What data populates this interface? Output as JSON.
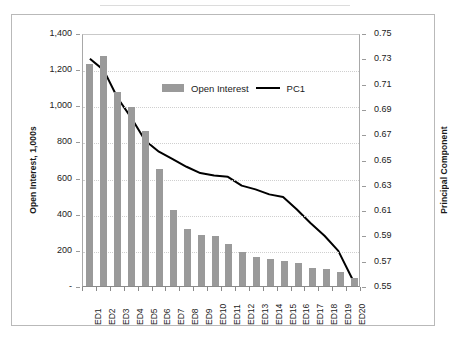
{
  "chart_data": {
    "type": "bar",
    "title": "",
    "subtitle": "",
    "categories": [
      "ED1",
      "ED2",
      "ED3",
      "ED4",
      "ED5",
      "ED6",
      "ED7",
      "ED8",
      "ED9",
      "ED10",
      "ED11",
      "ED12",
      "ED13",
      "ED14",
      "ED15",
      "ED16",
      "ED17",
      "ED18",
      "ED19",
      "ED20"
    ],
    "series": [
      {
        "name": "Open Interest",
        "type": "bar",
        "axis": "left",
        "color": "#9a9a9a",
        "values": [
          1230,
          1275,
          1075,
          990,
          860,
          650,
          420,
          315,
          280,
          275,
          230,
          190,
          160,
          150,
          140,
          125,
          100,
          95,
          80,
          45
        ]
      },
      {
        "name": "PC1",
        "type": "line",
        "axis": "right",
        "color": "#000000",
        "values": [
          0.731,
          0.722,
          0.7,
          0.684,
          0.666,
          0.657,
          0.651,
          0.645,
          0.64,
          0.638,
          0.637,
          0.63,
          0.627,
          0.623,
          0.621,
          0.611,
          0.6,
          0.59,
          0.578,
          0.556
        ]
      }
    ],
    "xlabel": "",
    "ylabel": "Open Interest, 1,000s",
    "y2label": "Principal Component",
    "ylim": [
      0,
      1400
    ],
    "y2lim": [
      0.55,
      0.75
    ],
    "yticks": [
      "-",
      "200",
      "400",
      "600",
      "800",
      "1,000",
      "1,200",
      "1,400"
    ],
    "y2ticks": [
      "0.55",
      "0.57",
      "0.59",
      "0.61",
      "0.63",
      "0.65",
      "0.67",
      "0.69",
      "0.71",
      "0.73",
      "0.75"
    ],
    "grid": "horizontal-dotted",
    "legend_position": "inside-top-center",
    "legend": [
      {
        "label": "Open Interest",
        "marker": "bar-swatch",
        "color": "#9a9a9a"
      },
      {
        "label": "PC1",
        "marker": "line",
        "color": "#000000"
      }
    ],
    "plot_background": "#ffffff",
    "frame_border_color": "#b9b9b9"
  }
}
